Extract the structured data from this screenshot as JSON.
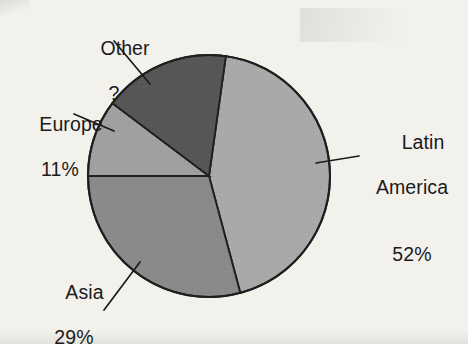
{
  "chart_data": {
    "type": "pie",
    "title": "",
    "subtitle": "",
    "xlabel": "",
    "ylabel": "",
    "legend_position": "none",
    "grid": false,
    "value_unit": "%",
    "start_angle_deg": 8,
    "direction": "clockwise",
    "categories": [
      "Latin America",
      "Asia",
      "Europe",
      "Other"
    ],
    "values": [
      52,
      29,
      11,
      8
    ],
    "labels_displayed": [
      "52%",
      "29%",
      "11%",
      "?"
    ],
    "slices": [
      {
        "name": "Latin America",
        "label_line1": "Latin",
        "label_line2": "America",
        "value_text": "52%",
        "value": 52,
        "color": "#a9a9a9",
        "start_angle_deg": 8,
        "end_angle_deg": 165
      },
      {
        "name": "Asia",
        "label_line1": "Asia",
        "label_line2": "",
        "value_text": "29%",
        "value": 29,
        "color": "#8a8a8a",
        "start_angle_deg": 165,
        "end_angle_deg": 270
      },
      {
        "name": "Europe",
        "label_line1": "Europe",
        "label_line2": "",
        "value_text": "11%",
        "value": 11,
        "color": "#a0a0a0",
        "start_angle_deg": 270,
        "end_angle_deg": 307
      },
      {
        "name": "Other",
        "label_line1": "Other",
        "label_line2": "",
        "value_text": "?",
        "value": 8,
        "color": "#565656",
        "start_angle_deg": 307,
        "end_angle_deg": 368
      }
    ]
  },
  "colors": {
    "background": "#f3f1ec",
    "outline": "#1f1f1f",
    "text": "#1b1b1b",
    "latin_america": "#a9a9a9",
    "asia": "#8a8a8a",
    "europe": "#a0a0a0",
    "other": "#565656"
  }
}
